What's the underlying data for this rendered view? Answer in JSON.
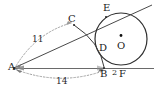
{
  "figure": {
    "type": "geometry-diagram",
    "stroke_color": "#3a3a3a",
    "dotted_color": "#8a8a8a",
    "label_color": "#1a1a1a",
    "background": "#ffffff"
  },
  "points": {
    "A": {
      "label": "A",
      "x": 14,
      "y": 68
    },
    "B": {
      "label": "B",
      "x": 104,
      "y": 68
    },
    "C": {
      "label": "C",
      "x": 73,
      "y": 24
    },
    "D": {
      "label": "D",
      "x": 101,
      "y": 48
    },
    "E": {
      "label": "E",
      "x": 107,
      "y": 12
    },
    "F": {
      "label": "F",
      "x": 122,
      "y": 68
    },
    "O": {
      "label": "O",
      "x": 121,
      "y": 39
    }
  },
  "measures": {
    "AC": "11",
    "AB": "14",
    "BF": "2"
  },
  "circle": {
    "center_x": 121,
    "center_y": 39,
    "radius": 26
  }
}
